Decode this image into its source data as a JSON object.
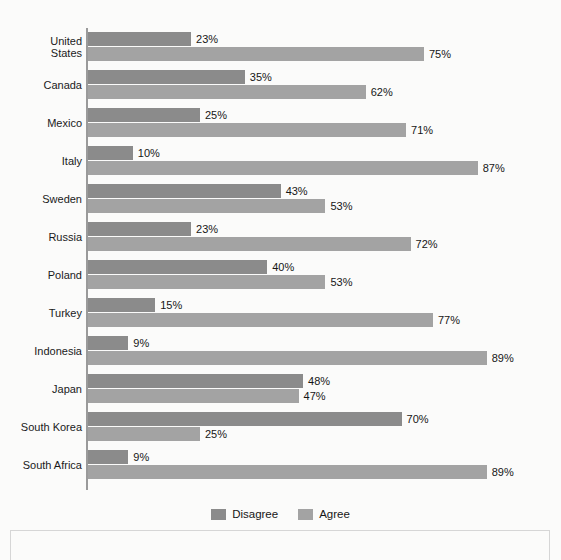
{
  "chart_data": {
    "type": "bar",
    "orientation": "horizontal",
    "title": "",
    "subtitle": "",
    "xlabel": "",
    "ylabel": "",
    "xlim": [
      0,
      100
    ],
    "grid": false,
    "value_suffix": "%",
    "legend_position": "bottom-center",
    "categories": [
      "United\nStates",
      "Canada",
      "Mexico",
      "Italy",
      "Sweden",
      "Russia",
      "Poland",
      "Turkey",
      "Indonesia",
      "Japan",
      "South Korea",
      "South Africa"
    ],
    "series": [
      {
        "name": "Disagree",
        "color": "#8b8b8b",
        "values": [
          23,
          35,
          25,
          10,
          43,
          23,
          40,
          15,
          9,
          48,
          70,
          9
        ],
        "labels": [
          "23%",
          "35%",
          "25%",
          "10%",
          "43%",
          "23%",
          "40%",
          "15%",
          "9%",
          "48%",
          "70%",
          "9%"
        ]
      },
      {
        "name": "Agree",
        "color": "#a3a3a3",
        "values": [
          75,
          62,
          71,
          87,
          53,
          72,
          53,
          77,
          89,
          47,
          25,
          89
        ],
        "labels": [
          "75%",
          "62%",
          "71%",
          "87%",
          "53%",
          "72%",
          "53%",
          "77%",
          "89%",
          "47%",
          "25%",
          "89%"
        ]
      }
    ]
  },
  "legend": {
    "items": [
      {
        "label": "Disagree",
        "color": "#8b8b8b"
      },
      {
        "label": "Agree",
        "color": "#a3a3a3"
      }
    ]
  },
  "colors": {
    "background": "#fbfbfa",
    "axis": "#9a9a9a",
    "text": "#161616",
    "disagree": "#8b8b8b",
    "agree": "#a3a3a3"
  }
}
